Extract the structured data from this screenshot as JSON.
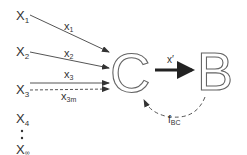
{
  "diagram": {
    "inputs": [
      {
        "name": "X",
        "sub": "1"
      },
      {
        "name": "X",
        "sub": "2"
      },
      {
        "name": "X",
        "sub": "3"
      },
      {
        "name": "X",
        "sub": "4"
      },
      {
        "name": "X",
        "sub": "∞"
      }
    ],
    "edges": [
      {
        "label": "x",
        "sub": "1",
        "style": "solid"
      },
      {
        "label": "x",
        "sub": "2",
        "style": "solid"
      },
      {
        "label": "x",
        "sub": "3",
        "style": "solid"
      },
      {
        "label": "x",
        "sub": "3m",
        "style": "dashed"
      }
    ],
    "node_c": "C",
    "node_b": "B",
    "forward_edge": {
      "label": "x′"
    },
    "feedback_edge": {
      "label": "f",
      "sub": "BC",
      "style": "dashed"
    },
    "colors": {
      "line": "#555555",
      "text": "#333333",
      "outline": "#666666"
    }
  }
}
